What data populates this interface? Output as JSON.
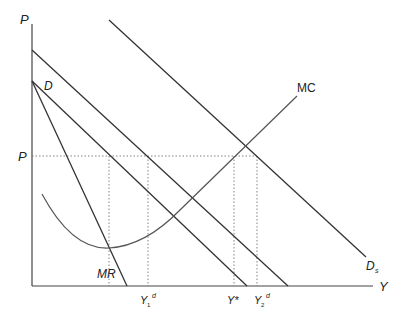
{
  "diagram": {
    "axes": {
      "y_label": "P",
      "x_label": "Y",
      "origin": [
        32,
        286
      ],
      "y_top": 24,
      "x_right": 373
    },
    "price_level_label": "P",
    "curves": {
      "D": {
        "label": "D",
        "from": [
          32,
          81
        ],
        "to": [
          247,
          286
        ]
      },
      "MR": {
        "label": "MR",
        "from": [
          32,
          81
        ],
        "to": [
          127,
          286
        ]
      },
      "D_mid": {
        "label": "",
        "from": [
          32,
          50
        ],
        "to": [
          288,
          286
        ]
      },
      "Ds": {
        "label": "D",
        "subscript": "s",
        "from": [
          109,
          20
        ],
        "to": [
          366,
          257
        ]
      },
      "MC": {
        "label": "MC"
      }
    },
    "x_ticks": [
      {
        "label": "Y",
        "sub": "1",
        "sup": "d",
        "x": 148
      },
      {
        "label": "Y*",
        "sub": "",
        "sup": "",
        "x": 234
      },
      {
        "label": "Y",
        "sub": "2",
        "sup": "d",
        "x": 257
      }
    ],
    "guides": {
      "price_y": 156,
      "mc_min_x": 109
    },
    "colors": {
      "line": "#333333",
      "mc": "#555555",
      "dotted": "#777777"
    }
  }
}
